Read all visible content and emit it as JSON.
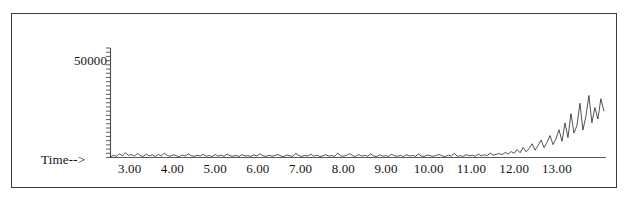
{
  "figure": {
    "background_color": "#ffffff",
    "frame_color": "#3b3b3b",
    "trace_color": "#1a1a1a",
    "axis_color": "#4a4a4a"
  },
  "axis_titles": {
    "x_axis_label": "Time-->",
    "y_tick_label": "50000"
  },
  "chart_data": {
    "type": "line",
    "title": "",
    "subtitle": "",
    "xlabel": "Time-->",
    "ylabel": "",
    "xlim": [
      2.55,
      14.15
    ],
    "ylim": [
      0,
      78000
    ],
    "grid": false,
    "legend": null,
    "annotations": [],
    "x_tick_labels": [
      "3.00",
      "4.00",
      "5.00",
      "6.00",
      "7.00",
      "8.00",
      "9.00",
      "10.00",
      "11.00",
      "12.00",
      "13.00"
    ],
    "x_tick_values": [
      3.0,
      4.0,
      5.0,
      6.0,
      7.0,
      8.0,
      9.0,
      10.0,
      11.0,
      12.0,
      13.0
    ],
    "y_tick_labels": [
      "50000"
    ],
    "y_tick_values": [
      50000
    ],
    "y_minor_tick_count": 26,
    "series": [
      {
        "name": "abundance",
        "x": [
          2.55,
          2.62,
          2.69,
          2.76,
          2.83,
          2.9,
          2.97,
          3.04,
          3.11,
          3.18,
          3.25,
          3.32,
          3.39,
          3.46,
          3.53,
          3.6,
          3.67,
          3.74,
          3.81,
          3.88,
          3.95,
          4.02,
          4.09,
          4.16,
          4.23,
          4.3,
          4.37,
          4.44,
          4.51,
          4.58,
          4.65,
          4.72,
          4.79,
          4.86,
          4.93,
          5.0,
          5.07,
          5.14,
          5.21,
          5.28,
          5.35,
          5.42,
          5.49,
          5.56,
          5.63,
          5.7,
          5.77,
          5.84,
          5.91,
          5.98,
          6.05,
          6.12,
          6.19,
          6.26,
          6.33,
          6.4,
          6.47,
          6.54,
          6.61,
          6.68,
          6.75,
          6.82,
          6.89,
          6.96,
          7.03,
          7.1,
          7.17,
          7.24,
          7.31,
          7.38,
          7.45,
          7.52,
          7.59,
          7.66,
          7.73,
          7.8,
          7.87,
          7.94,
          8.01,
          8.08,
          8.15,
          8.22,
          8.29,
          8.36,
          8.43,
          8.5,
          8.57,
          8.64,
          8.71,
          8.78,
          8.85,
          8.92,
          8.99,
          9.06,
          9.13,
          9.2,
          9.27,
          9.34,
          9.41,
          9.48,
          9.55,
          9.62,
          9.69,
          9.76,
          9.83,
          9.9,
          9.97,
          10.04,
          10.11,
          10.18,
          10.25,
          10.32,
          10.39,
          10.46,
          10.53,
          10.6,
          10.67,
          10.74,
          10.81,
          10.88,
          10.95,
          11.02,
          11.09,
          11.16,
          11.23,
          11.3,
          11.37,
          11.44,
          11.51,
          11.58,
          11.65,
          11.72,
          11.79,
          11.86,
          11.93,
          12.0,
          12.07,
          12.14,
          12.21,
          12.28,
          12.35,
          12.42,
          12.49,
          12.56,
          12.63,
          12.7,
          12.77,
          12.84,
          12.91,
          12.98,
          13.05,
          13.12,
          13.19,
          13.26,
          13.33,
          13.4,
          13.47,
          13.54,
          13.61,
          13.68,
          13.75,
          13.82,
          13.89,
          13.96,
          14.03,
          14.1
        ],
        "y": [
          600,
          1400,
          900,
          2600,
          1200,
          3400,
          1500,
          2100,
          1000,
          2900,
          1300,
          800,
          2400,
          1100,
          1900,
          700,
          2200,
          1000,
          3100,
          1400,
          900,
          2000,
          1200,
          700,
          1800,
          1000,
          2600,
          1300,
          800,
          1600,
          1100,
          2300,
          900,
          1400,
          700,
          2100,
          1000,
          1700,
          800,
          2500,
          1200,
          900,
          1500,
          700,
          2000,
          1100,
          1300,
          800,
          1900,
          1000,
          2700,
          1200,
          800,
          1600,
          900,
          1400,
          2200,
          1000,
          700,
          1800,
          1100,
          900,
          3000,
          1300,
          800,
          1500,
          1000,
          2400,
          900,
          1700,
          700,
          1200,
          2000,
          1000,
          1400,
          800,
          3200,
          1100,
          900,
          1600,
          2800,
          1200,
          800,
          2100,
          1000,
          1500,
          900,
          2600,
          1100,
          700,
          1900,
          1000,
          1300,
          800,
          2300,
          1200,
          900,
          1600,
          700,
          2000,
          1100,
          1400,
          900,
          2500,
          1000,
          800,
          1800,
          1200,
          900,
          1500,
          2200,
          1000,
          700,
          1700,
          1100,
          2900,
          900,
          1300,
          800,
          2000,
          1200,
          1600,
          900,
          2400,
          1100,
          1900,
          1400,
          3100,
          1700,
          2300,
          2800,
          2000,
          3600,
          2500,
          4200,
          3000,
          5600,
          3400,
          7200,
          4100,
          6400,
          9800,
          5200,
          8600,
          12400,
          7000,
          10800,
          15600,
          9200,
          13400,
          19800,
          11600,
          24600,
          14200,
          31200,
          17400,
          22800,
          38600,
          19600,
          29400,
          44200,
          24800,
          35600,
          27400,
          41800,
          33200
        ]
      }
    ]
  }
}
